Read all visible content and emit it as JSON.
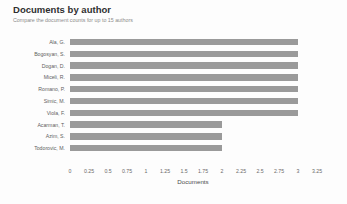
{
  "header": {
    "title": "Documents by author",
    "subtitle": "Compare the document counts for up to 15 authors"
  },
  "chart_data": {
    "type": "bar",
    "orientation": "horizontal",
    "title": "Documents by author",
    "subtitle": "Compare the document counts for up to 15 authors",
    "xlabel": "Documents",
    "ylabel": "",
    "categories": [
      "Ala, G.",
      "Bogosyan, S.",
      "Dogan, D.",
      "Miceli, R.",
      "Romano, P.",
      "Simic, M.",
      "Viola, F.",
      "Acarman, T.",
      "Azim, S.",
      "Todorovic, M."
    ],
    "values": [
      3,
      3,
      3,
      3,
      3,
      3,
      3,
      2,
      2,
      2
    ],
    "bar_count": 11,
    "xlim": [
      0,
      3.25
    ],
    "xticks": [
      0,
      0.25,
      0.5,
      0.75,
      1,
      1.25,
      1.5,
      1.75,
      2,
      2.25,
      2.5,
      2.75,
      3,
      3.25
    ],
    "xtick_labels": [
      "0",
      "0.25",
      "0.5",
      "0.75",
      "1",
      "1.25",
      "1.5",
      "1.75",
      "2",
      "2.25",
      "2.5",
      "2.75",
      "3",
      "3.25"
    ],
    "grid": false,
    "legend": false,
    "bar_color": "#9a9a9a",
    "background_color": "#fdfdfd"
  }
}
